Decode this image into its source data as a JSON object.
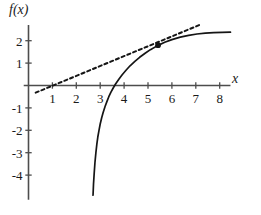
{
  "chart_data": {
    "type": "line",
    "title": "",
    "xlabel": "x",
    "ylabel": "f(x)",
    "xlim": [
      -0.2,
      8.6
    ],
    "ylim": [
      -5.1,
      2.9
    ],
    "grid": false,
    "legend": null,
    "xticks": [
      1,
      2,
      3,
      4,
      5,
      6,
      7,
      8
    ],
    "xtick_labels": [
      "1",
      "2",
      "3",
      "4",
      "5",
      "6",
      "7",
      "8"
    ],
    "yticks": [
      2,
      1,
      -1,
      -2,
      -3,
      -4
    ],
    "ytick_labels": [
      "2",
      "1",
      "-1",
      "-2",
      "-3",
      "-4"
    ],
    "series": [
      {
        "name": "f(x)",
        "style": "solid",
        "color": "#151515",
        "points": [
          [
            2.7,
            -4.9
          ],
          [
            2.72,
            -4.4
          ],
          [
            2.75,
            -3.9
          ],
          [
            2.78,
            -3.45
          ],
          [
            2.82,
            -3.0
          ],
          [
            2.86,
            -2.62
          ],
          [
            2.9,
            -2.3
          ],
          [
            2.95,
            -2.0
          ],
          [
            3.0,
            -1.72
          ],
          [
            3.06,
            -1.45
          ],
          [
            3.12,
            -1.22
          ],
          [
            3.2,
            -0.95
          ],
          [
            3.28,
            -0.72
          ],
          [
            3.36,
            -0.5
          ],
          [
            3.45,
            -0.3
          ],
          [
            3.55,
            -0.1
          ],
          [
            3.65,
            0.08
          ],
          [
            3.78,
            0.28
          ],
          [
            3.92,
            0.48
          ],
          [
            4.08,
            0.68
          ],
          [
            4.25,
            0.88
          ],
          [
            4.45,
            1.08
          ],
          [
            4.65,
            1.26
          ],
          [
            4.88,
            1.44
          ],
          [
            5.1,
            1.6
          ],
          [
            5.4,
            1.78
          ],
          [
            5.7,
            1.93
          ],
          [
            6.0,
            2.05
          ],
          [
            6.35,
            2.16
          ],
          [
            6.7,
            2.24
          ],
          [
            7.05,
            2.3
          ],
          [
            7.4,
            2.34
          ],
          [
            7.75,
            2.36
          ],
          [
            8.1,
            2.37
          ],
          [
            8.45,
            2.38
          ]
        ]
      },
      {
        "name": "tangent line at point of tangency",
        "style": "dashed",
        "color": "#151515",
        "points": [
          [
            0.3,
            -0.32
          ],
          [
            7.15,
            2.7
          ]
        ]
      }
    ],
    "annotations": [
      {
        "name": "point-of-tangency",
        "type": "point",
        "x": 5.42,
        "y": 1.8,
        "marker": "filled-circle"
      }
    ]
  }
}
